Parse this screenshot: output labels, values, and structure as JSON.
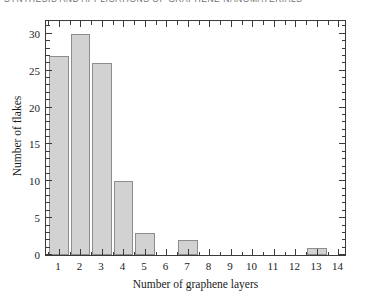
{
  "page_header": {
    "text": "SYNTHESIS AND APPLICATIONS OF GRAPHENE NANOMATERIALS",
    "note": "clipped running head at top edge"
  },
  "chart_data": {
    "type": "bar",
    "title": "",
    "xlabel": "Number of graphene layers",
    "ylabel": "Number of flakes",
    "categories": [
      1,
      2,
      3,
      4,
      5,
      6,
      7,
      8,
      9,
      10,
      11,
      12,
      13,
      14
    ],
    "values": [
      27,
      30,
      26,
      10,
      3,
      0,
      2,
      0,
      0,
      0,
      0,
      0,
      1,
      0
    ],
    "xlim": [
      0.4,
      14.4
    ],
    "ylim": [
      0,
      32
    ],
    "x_ticks": [
      1,
      2,
      3,
      4,
      5,
      6,
      7,
      8,
      9,
      10,
      11,
      12,
      13,
      14
    ],
    "y_ticks": [
      0,
      5,
      10,
      15,
      20,
      25,
      30
    ],
    "y_minor_step": 1,
    "grid": false,
    "legend": null,
    "bar_fill_color": "#d2d2d2",
    "bar_edge_color": "#8d8d8d",
    "axis_color": "#3a3a3a",
    "frame": "box-all-sides",
    "tick_direction": "in"
  }
}
